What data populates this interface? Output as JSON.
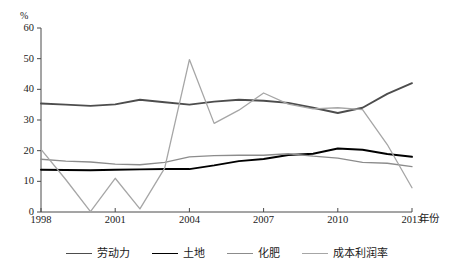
{
  "chart_data": {
    "type": "line",
    "title": "",
    "xlabel": "年份",
    "ylabel": "%",
    "xlim": [
      1998,
      2013
    ],
    "ylim": [
      0,
      60
    ],
    "grid": false,
    "legend_position": "bottom",
    "x": [
      1998,
      1999,
      2000,
      2001,
      2002,
      2003,
      2004,
      2005,
      2006,
      2007,
      2008,
      2009,
      2010,
      2011,
      2012,
      2013
    ],
    "x_tick_labels": [
      "1998",
      "2001",
      "2004",
      "2007",
      "2010",
      "2013"
    ],
    "x_ticks": [
      1998,
      2001,
      2004,
      2007,
      2010,
      2013
    ],
    "y_tick_labels": [
      "0",
      "10",
      "20",
      "30",
      "40",
      "50",
      "60"
    ],
    "y_ticks": [
      0,
      10,
      20,
      30,
      40,
      50,
      60
    ],
    "series": [
      {
        "name": "劳动力",
        "color": "#4d4d4d",
        "width": 1.9,
        "values": [
          35.4,
          35.0,
          34.6,
          35.1,
          36.6,
          35.8,
          35.0,
          36.0,
          36.6,
          36.3,
          35.6,
          34.0,
          32.3,
          34.0,
          38.5,
          42.0
        ]
      },
      {
        "name": "土地",
        "color": "#000000",
        "width": 1.9,
        "values": [
          13.8,
          13.7,
          13.6,
          13.8,
          13.9,
          14.0,
          14.0,
          15.2,
          16.6,
          17.3,
          18.6,
          19.0,
          20.7,
          20.3,
          18.9,
          18.0
        ]
      },
      {
        "name": "化肥",
        "color": "#8c8c8c",
        "width": 1.3,
        "values": [
          17.2,
          16.6,
          16.3,
          15.6,
          15.4,
          16.2,
          18.0,
          18.4,
          18.5,
          18.5,
          19.0,
          18.2,
          17.6,
          16.2,
          15.9,
          14.8
        ]
      },
      {
        "name": "成本利润率",
        "color": "#a6a6a6",
        "width": 1.3,
        "values": [
          20.4,
          10.6,
          0.1,
          11.0,
          1.0,
          14.3,
          49.7,
          28.9,
          33.2,
          38.8,
          35.2,
          33.6,
          34.0,
          33.4,
          22.0,
          7.9
        ]
      }
    ]
  },
  "axis": {
    "unit_label": "%",
    "x_title": "年份"
  }
}
